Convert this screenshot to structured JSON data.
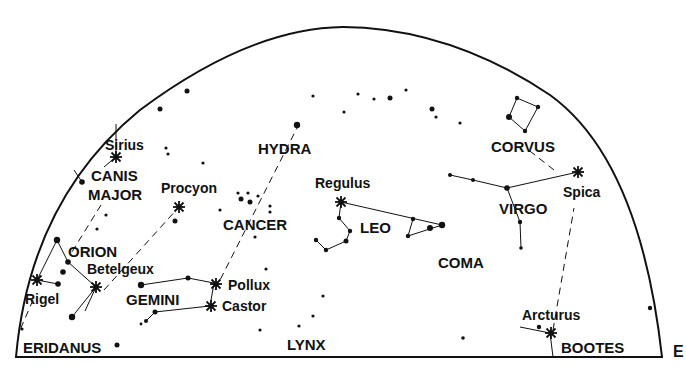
{
  "diagram": {
    "type": "star-map",
    "view": "southern horizon half-dome",
    "ink_color": "#111111",
    "background": "#ffffff",
    "edge_marker": "E",
    "constellations": [
      {
        "name": "CANIS MAJOR",
        "line1": "CANIS",
        "line2": "MAJOR"
      },
      {
        "name": "ORION"
      },
      {
        "name": "GEMINI"
      },
      {
        "name": "HYDRA"
      },
      {
        "name": "CANCER"
      },
      {
        "name": "LEO"
      },
      {
        "name": "CORVUS"
      },
      {
        "name": "VIRGO"
      },
      {
        "name": "COMA"
      },
      {
        "name": "LYNX"
      },
      {
        "name": "ERIDANUS"
      },
      {
        "name": "BOOTES"
      }
    ],
    "bright_stars": [
      {
        "name": "Sirius"
      },
      {
        "name": "Procyon"
      },
      {
        "name": "Betelgeux"
      },
      {
        "name": "Rigel"
      },
      {
        "name": "Pollux"
      },
      {
        "name": "Castor"
      },
      {
        "name": "Regulus"
      },
      {
        "name": "Spica"
      },
      {
        "name": "Arcturus"
      }
    ]
  }
}
